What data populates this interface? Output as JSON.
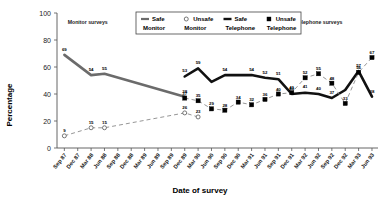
{
  "chart_data": {
    "type": "line",
    "title": "",
    "xlabel": "Date of survey",
    "ylabel": "Percentage",
    "ylim": [
      0,
      100
    ],
    "yticks": [
      0,
      20,
      40,
      60,
      80,
      100
    ],
    "grid": false,
    "legend_position": "top-center",
    "categories": [
      "Sep 87",
      "Dec 87",
      "Mar 88",
      "Jun 88",
      "Sep 88",
      "Dec 88",
      "Mar 89",
      "Jun 89",
      "Sep 89",
      "Dec 89",
      "Mar 90",
      "Jun 90",
      "Sep 90",
      "Dec 90",
      "Mar 91",
      "Jun 91",
      "Sep 91",
      "Dec 91",
      "Mar 92",
      "Jun 92",
      "Sep 92",
      "Dec 92",
      "Mar 93",
      "Jun 93"
    ],
    "annotations": [
      {
        "text": "Monitor surveys",
        "x": "Dec 87"
      },
      {
        "text": "Telephone surveys",
        "x": "Mar 92"
      }
    ],
    "series": [
      {
        "name": "Safe Monitor",
        "key": "safe_monitor",
        "marker": "line",
        "style": "solid-thick-grey",
        "points": [
          {
            "x": "Sep 87",
            "y": 69,
            "label": "69"
          },
          {
            "x": "Mar 88",
            "y": 54,
            "label": "54"
          },
          {
            "x": "Jun 88",
            "y": 55,
            "label": "55"
          },
          {
            "x": "Dec 89",
            "y": 38,
            "label": "38"
          }
        ]
      },
      {
        "name": "Unsafe Monitor",
        "key": "unsafe_monitor",
        "marker": "open-circle",
        "style": "dashed-thin",
        "points": [
          {
            "x": "Sep 87",
            "y": 9,
            "label": "9"
          },
          {
            "x": "Mar 88",
            "y": 15,
            "label": "15"
          },
          {
            "x": "Jun 88",
            "y": 15,
            "label": "15"
          },
          {
            "x": "Dec 89",
            "y": 26,
            "label": "26"
          },
          {
            "x": "Mar 90",
            "y": 23,
            "label": "23"
          }
        ]
      },
      {
        "name": "Safe Telephone",
        "key": "safe_telephone",
        "marker": "line",
        "style": "solid-thick-black",
        "points": [
          {
            "x": "Dec 89",
            "y": 53,
            "label": "53"
          },
          {
            "x": "Mar 90",
            "y": 59,
            "label": "59"
          },
          {
            "x": "Jun 90",
            "y": 49,
            "label": ""
          },
          {
            "x": "Sep 90",
            "y": 54,
            "label": "54"
          },
          {
            "x": "Dec 90",
            "y": 54,
            "label": ""
          },
          {
            "x": "Mar 91",
            "y": 54,
            "label": "54"
          },
          {
            "x": "Jun 91",
            "y": 52,
            "label": "52"
          },
          {
            "x": "Sep 91",
            "y": 51,
            "label": "51"
          },
          {
            "x": "Dec 91",
            "y": 40,
            "label": "40"
          },
          {
            "x": "Mar 92",
            "y": 41,
            "label": "41"
          },
          {
            "x": "Jun 92",
            "y": 40,
            "label": "40"
          },
          {
            "x": "Sep 92",
            "y": 37,
            "label": "37"
          },
          {
            "x": "Dec 92",
            "y": 43,
            "label": ""
          },
          {
            "x": "Mar 93",
            "y": 57,
            "label": "57"
          },
          {
            "x": "Jun 93",
            "y": 38,
            "label": "38"
          }
        ]
      },
      {
        "name": "Unsafe Telephone",
        "key": "unsafe_telephone",
        "marker": "filled-square",
        "style": "dashed-thin",
        "points": [
          {
            "x": "Dec 89",
            "y": 37,
            "label": "37"
          },
          {
            "x": "Mar 90",
            "y": 35,
            "label": "35"
          },
          {
            "x": "Jun 90",
            "y": 29,
            "label": "29"
          },
          {
            "x": "Sep 90",
            "y": 28,
            "label": "28"
          },
          {
            "x": "Dec 90",
            "y": 34,
            "label": "34"
          },
          {
            "x": "Mar 91",
            "y": 32,
            "label": "32"
          },
          {
            "x": "Jun 91",
            "y": 36,
            "label": "36"
          },
          {
            "x": "Sep 91",
            "y": 40,
            "label": "40"
          },
          {
            "x": "Dec 91",
            "y": 41,
            "label": "41"
          },
          {
            "x": "Mar 92",
            "y": 52,
            "label": "52"
          },
          {
            "x": "Jun 92",
            "y": 55,
            "label": "55"
          },
          {
            "x": "Sep 92",
            "y": 48,
            "label": "48"
          },
          {
            "x": "Dec 92",
            "y": 33,
            "label": "33"
          },
          {
            "x": "Mar 93",
            "y": 56,
            "label": "56"
          },
          {
            "x": "Jun 93",
            "y": 67,
            "label": "67"
          }
        ]
      }
    ]
  },
  "legend": {
    "items": [
      {
        "line1": "Safe",
        "line2": "Monitor",
        "glyph": "solid-line-grey"
      },
      {
        "line1": "Unsafe",
        "line2": "Monitor",
        "glyph": "open-circle"
      },
      {
        "line1": "Safe",
        "line2": "Telephone",
        "glyph": "solid-line-black"
      },
      {
        "line1": "Unsafe",
        "line2": "Telephone",
        "glyph": "filled-square"
      }
    ]
  },
  "colors": {
    "safe_monitor": "#6b6b6b",
    "unsafe_monitor": "#8a8a8a",
    "safe_telephone": "#111111",
    "unsafe_telephone": "#000000",
    "axis": "#555555",
    "background": "#ffffff"
  }
}
